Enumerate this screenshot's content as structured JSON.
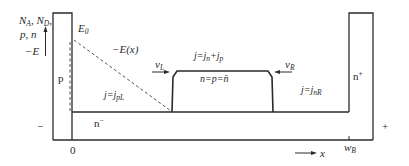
{
  "diagram": {
    "type": "p-n⁻-n⁺ diode carrier/field distribution",
    "axis": {
      "ylabel_line1_a": "N",
      "ylabel_line1_a_sub": "A",
      "ylabel_line1_b": "N",
      "ylabel_line1_b_sub": "D",
      "ylabel_line2": "p, n",
      "ylabel_line3": "−E",
      "x_label": "x",
      "origin": "0",
      "wB": "w",
      "wB_sub": "B"
    },
    "regions": {
      "p": "p",
      "n_minus": "n",
      "n_minus_sup": "−",
      "n_plus": "n",
      "n_plus_sup": "+"
    },
    "terminals": {
      "minus": "−",
      "plus": "+"
    },
    "annotations": {
      "E0": "E",
      "E0_sub": "0",
      "Ex": "−E(x)",
      "vL": "v",
      "vL_sub": "L",
      "vR": "v",
      "vR_sub": "R",
      "j_total": "j=j",
      "j_total_sub1": "n",
      "j_total_plus": "+j",
      "j_total_sub2": "p",
      "j_left": "j=j",
      "j_left_sub": "pL",
      "j_right": "j=j",
      "j_right_sub": "nR",
      "plasma": "n=p=n̄"
    },
    "colors": {
      "line": "#2a2a2a",
      "dashed": "#555555",
      "background": "#ffffff"
    }
  }
}
